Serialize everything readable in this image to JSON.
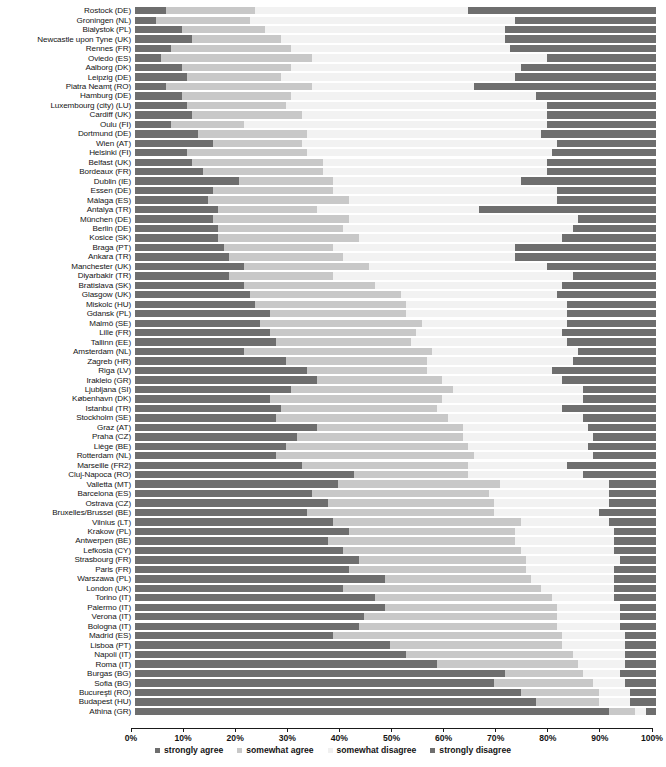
{
  "chart_data": {
    "type": "bar",
    "subtype": "stacked-horizontal-100pct",
    "title": "",
    "subtitle": "",
    "xlabel": "",
    "ylabel": "",
    "xlim": [
      0,
      100
    ],
    "grid": false,
    "legend_position": "bottom-center",
    "axis_ticks": [
      "0%",
      "10%",
      "20%",
      "30%",
      "40%",
      "50%",
      "60%",
      "70%",
      "80%",
      "90%",
      "100%"
    ],
    "axis_tick_values": [
      0,
      10,
      20,
      30,
      40,
      50,
      60,
      70,
      80,
      90,
      100
    ],
    "legend": [
      {
        "name": "strongly agree",
        "color": "#6e6e6e"
      },
      {
        "name": "somewhat agree",
        "color": "#c8c8c8"
      },
      {
        "name": "somewhat disagree",
        "color": "#f0f0f0"
      },
      {
        "name": "strongly disagree",
        "color": "#6e6e6e"
      }
    ],
    "series": [
      {
        "name": "strongly agree",
        "color": "#6e6e6e"
      },
      {
        "name": "somewhat agree",
        "color": "#c8c8c8"
      },
      {
        "name": "somewhat disagree",
        "color": "#f2f2f2"
      },
      {
        "name": "strongly disagree",
        "color": "#6e6e6e"
      }
    ],
    "categories": [
      "Rostock (DE)",
      "Groningen (NL)",
      "Bialystok (PL)",
      "Newcastle upon Tyne (UK)",
      "Rennes (FR)",
      "Oviedo (ES)",
      "Aalborg (DK)",
      "Leipzig (DE)",
      "Piatra Neamţ (RO)",
      "Hamburg (DE)",
      "Luxembourg (city) (LU)",
      "Cardiff (UK)",
      "Oulu (FI)",
      "Dortmund (DE)",
      "Wien (AT)",
      "Helsinki (FI)",
      "Belfast (UK)",
      "Bordeaux (FR)",
      "Dublin (IE)",
      "Essen (DE)",
      "Málaga (ES)",
      "Antalya (TR)",
      "München (DE)",
      "Berlin (DE)",
      "Kosice (SK)",
      "Braga (PT)",
      "Ankara (TR)",
      "Manchester (UK)",
      "Diyarbakir (TR)",
      "Bratislava (SK)",
      "Glasgow (UK)",
      "Miskolc (HU)",
      "Gdansk (PL)",
      "Malmö (SE)",
      "Lille (FR)",
      "Tallinn (EE)",
      "Amsterdam (NL)",
      "Zagreb (HR)",
      "Riga (LV)",
      "Irakleio (GR)",
      "Ljubljana (SI)",
      "København (DK)",
      "Istanbul (TR)",
      "Stockholm (SE)",
      "Graz (AT)",
      "Praha (CZ)",
      "Liège (BE)",
      "Rotterdam (NL)",
      "Marseille (FR2)",
      "Cluj-Napoca (RO)",
      "Valletta (MT)",
      "Barcelona (ES)",
      "Ostrava (CZ)",
      "Bruxelles/Brussel (BE)",
      "Vilnius (LT)",
      "Krakow (PL)",
      "Antwerpen (BE)",
      "Lefkosia (CY)",
      "Strasbourg (FR)",
      "Paris (FR)",
      "Warszawa (PL)",
      "London (UK)",
      "Torino (IT)",
      "Palermo (IT)",
      "Verona (IT)",
      "Bologna (IT)",
      "Madrid (ES)",
      "Lisboa (PT)",
      "Napoli (IT)",
      "Roma (IT)",
      "Burgas (BG)",
      "Sofia (BG)",
      "Bucureşti (RO)",
      "Budapest (HU)",
      "Athina (GR)"
    ],
    "rows": [
      {
        "label": "Rostock (DE)",
        "values": [
          6,
          17,
          41,
          36
        ]
      },
      {
        "label": "Groningen (NL)",
        "values": [
          4,
          18,
          51,
          27
        ]
      },
      {
        "label": "Bialystok (PL)",
        "values": [
          9,
          16,
          46,
          29
        ]
      },
      {
        "label": "Newcastle upon Tyne (UK)",
        "values": [
          11,
          17,
          43,
          29
        ]
      },
      {
        "label": "Rennes (FR)",
        "values": [
          7,
          23,
          42,
          28
        ]
      },
      {
        "label": "Oviedo (ES)",
        "values": [
          5,
          29,
          45,
          21
        ]
      },
      {
        "label": "Aalborg (DK)",
        "values": [
          9,
          21,
          44,
          26
        ]
      },
      {
        "label": "Leipzig (DE)",
        "values": [
          10,
          18,
          45,
          27
        ]
      },
      {
        "label": "Piatra Neamţ (RO)",
        "values": [
          6,
          28,
          31,
          35
        ]
      },
      {
        "label": "Hamburg (DE)",
        "values": [
          9,
          21,
          47,
          23
        ]
      },
      {
        "label": "Luxembourg (city) (LU)",
        "values": [
          10,
          19,
          50,
          21
        ]
      },
      {
        "label": "Cardiff (UK)",
        "values": [
          11,
          21,
          47,
          21
        ]
      },
      {
        "label": "Oulu (FI)",
        "values": [
          7,
          14,
          58,
          21
        ]
      },
      {
        "label": "Dortmund (DE)",
        "values": [
          12,
          21,
          45,
          22
        ]
      },
      {
        "label": "Wien (AT)",
        "values": [
          15,
          17,
          49,
          19
        ]
      },
      {
        "label": "Helsinki (FI)",
        "values": [
          10,
          23,
          47,
          20
        ]
      },
      {
        "label": "Belfast (UK)",
        "values": [
          11,
          25,
          43,
          21
        ]
      },
      {
        "label": "Bordeaux (FR)",
        "values": [
          13,
          23,
          43,
          21
        ]
      },
      {
        "label": "Dublin (IE)",
        "values": [
          20,
          18,
          36,
          26
        ]
      },
      {
        "label": "Essen (DE)",
        "values": [
          15,
          23,
          43,
          19
        ]
      },
      {
        "label": "Málaga (ES)",
        "values": [
          14,
          27,
          40,
          19
        ]
      },
      {
        "label": "Antalya (TR)",
        "values": [
          16,
          19,
          31,
          34
        ]
      },
      {
        "label": "München (DE)",
        "values": [
          15,
          26,
          44,
          15
        ]
      },
      {
        "label": "Berlin (DE)",
        "values": [
          16,
          24,
          44,
          16
        ]
      },
      {
        "label": "Kosice (SK)",
        "values": [
          16,
          27,
          39,
          18
        ]
      },
      {
        "label": "Braga (PT)",
        "values": [
          17,
          21,
          35,
          27
        ]
      },
      {
        "label": "Ankara (TR)",
        "values": [
          18,
          22,
          33,
          27
        ]
      },
      {
        "label": "Manchester (UK)",
        "values": [
          21,
          24,
          34,
          21
        ]
      },
      {
        "label": "Diyarbakir (TR)",
        "values": [
          18,
          20,
          46,
          16
        ]
      },
      {
        "label": "Bratislava (SK)",
        "values": [
          21,
          25,
          36,
          18
        ]
      },
      {
        "label": "Glasgow (UK)",
        "values": [
          22,
          29,
          30,
          19
        ]
      },
      {
        "label": "Miskolc (HU)",
        "values": [
          23,
          29,
          31,
          17
        ]
      },
      {
        "label": "Gdansk (PL)",
        "values": [
          26,
          26,
          31,
          17
        ]
      },
      {
        "label": "Malmö (SE)",
        "values": [
          24,
          31,
          28,
          17
        ]
      },
      {
        "label": "Lille (FR)",
        "values": [
          26,
          28,
          28,
          18
        ]
      },
      {
        "label": "Tallinn (EE)",
        "values": [
          27,
          26,
          30,
          17
        ]
      },
      {
        "label": "Amsterdam (NL)",
        "values": [
          21,
          36,
          28,
          15
        ]
      },
      {
        "label": "Zagreb (HR)",
        "values": [
          29,
          27,
          28,
          16
        ]
      },
      {
        "label": "Riga (LV)",
        "values": [
          33,
          23,
          24,
          20
        ]
      },
      {
        "label": "Irakleio (GR)",
        "values": [
          35,
          24,
          23,
          18
        ]
      },
      {
        "label": "Ljubljana (SI)",
        "values": [
          30,
          31,
          25,
          14
        ]
      },
      {
        "label": "København (DK)",
        "values": [
          26,
          33,
          27,
          14
        ]
      },
      {
        "label": "Istanbul (TR)",
        "values": [
          28,
          30,
          24,
          18
        ]
      },
      {
        "label": "Stockholm (SE)",
        "values": [
          27,
          33,
          26,
          14
        ]
      },
      {
        "label": "Graz (AT)",
        "values": [
          35,
          28,
          24,
          13
        ]
      },
      {
        "label": "Praha (CZ)",
        "values": [
          31,
          32,
          25,
          12
        ]
      },
      {
        "label": "Liège (BE)",
        "values": [
          29,
          35,
          23,
          13
        ]
      },
      {
        "label": "Rotterdam (NL)",
        "values": [
          27,
          38,
          23,
          12
        ]
      },
      {
        "label": "Marseille (FR2)",
        "values": [
          32,
          32,
          19,
          17
        ]
      },
      {
        "label": "Cluj-Napoca (RO)",
        "values": [
          42,
          22,
          22,
          14
        ]
      },
      {
        "label": "Valletta (MT)",
        "values": [
          39,
          31,
          21,
          9
        ]
      },
      {
        "label": "Barcelona (ES)",
        "values": [
          34,
          34,
          23,
          9
        ]
      },
      {
        "label": "Ostrava (CZ)",
        "values": [
          37,
          32,
          22,
          9
        ]
      },
      {
        "label": "Bruxelles/Brussel (BE)",
        "values": [
          33,
          36,
          20,
          11
        ]
      },
      {
        "label": "Vilnius (LT)",
        "values": [
          38,
          36,
          17,
          9
        ]
      },
      {
        "label": "Krakow (PL)",
        "values": [
          41,
          32,
          19,
          8
        ]
      },
      {
        "label": "Antwerpen (BE)",
        "values": [
          37,
          36,
          19,
          8
        ]
      },
      {
        "label": "Lefkosia (CY)",
        "values": [
          40,
          34,
          18,
          8
        ]
      },
      {
        "label": "Strasbourg (FR)",
        "values": [
          43,
          32,
          18,
          7
        ]
      },
      {
        "label": "Paris (FR)",
        "values": [
          41,
          34,
          17,
          8
        ]
      },
      {
        "label": "Warszawa (PL)",
        "values": [
          48,
          28,
          16,
          8
        ]
      },
      {
        "label": "London (UK)",
        "values": [
          40,
          38,
          14,
          8
        ]
      },
      {
        "label": "Torino (IT)",
        "values": [
          46,
          34,
          12,
          8
        ]
      },
      {
        "label": "Palermo (IT)",
        "values": [
          48,
          33,
          12,
          7
        ]
      },
      {
        "label": "Verona (IT)",
        "values": [
          44,
          37,
          12,
          7
        ]
      },
      {
        "label": "Bologna (IT)",
        "values": [
          43,
          38,
          12,
          7
        ]
      },
      {
        "label": "Madrid (ES)",
        "values": [
          38,
          44,
          12,
          6
        ]
      },
      {
        "label": "Lisboa (PT)",
        "values": [
          49,
          33,
          12,
          6
        ]
      },
      {
        "label": "Napoli (IT)",
        "values": [
          52,
          32,
          10,
          6
        ]
      },
      {
        "label": "Roma (IT)",
        "values": [
          58,
          27,
          9,
          6
        ]
      },
      {
        "label": "Burgas (BG)",
        "values": [
          71,
          15,
          7,
          7
        ]
      },
      {
        "label": "Sofia (BG)",
        "values": [
          69,
          19,
          6,
          6
        ]
      },
      {
        "label": "Bucureşti (RO)",
        "values": [
          74,
          15,
          6,
          5
        ]
      },
      {
        "label": "Budapest (HU)",
        "values": [
          77,
          12,
          6,
          5
        ]
      },
      {
        "label": "Athina (GR)",
        "values": [
          91,
          5,
          2,
          2
        ]
      }
    ]
  }
}
